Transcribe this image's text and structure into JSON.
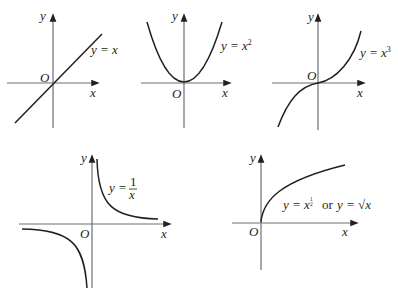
{
  "diagram": {
    "axis_labels": {
      "x": "x",
      "y": "y",
      "origin": "O"
    },
    "panels": [
      {
        "id": "linear",
        "equation": "y = x",
        "eq_lhs": "y = ",
        "eq_base": "x",
        "eq_exp": ""
      },
      {
        "id": "square",
        "equation": "y = x^2",
        "eq_lhs": "y = ",
        "eq_base": "x",
        "eq_exp": "2"
      },
      {
        "id": "cube",
        "equation": "y = x^3",
        "eq_lhs": "y = ",
        "eq_base": "x",
        "eq_exp": "3"
      },
      {
        "id": "reciprocal",
        "equation": "y = 1/x",
        "eq_lhs": "y = ",
        "eq_num": "1",
        "eq_den": "x"
      },
      {
        "id": "sqrt",
        "equation": "y = x^(1/2) or y = √x",
        "eq_lhs": "y = ",
        "eq_base": "x",
        "eq_exp_num": "1",
        "eq_exp_den": "2",
        "eq_or": "or",
        "eq_alt_lhs": "y = ",
        "eq_alt_rad": "√",
        "eq_alt_base": "x"
      }
    ],
    "colors": {
      "curve": "#231f20",
      "axis": "#6d6e71",
      "background": "#ffffff"
    }
  }
}
